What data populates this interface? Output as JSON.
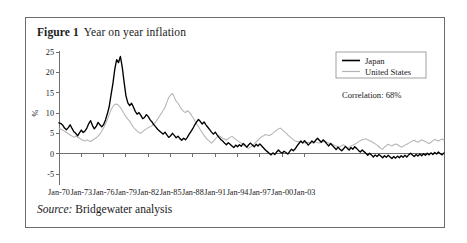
{
  "figure": {
    "label": "Figure 1",
    "title": "Year on year inflation",
    "source_word": "Source:",
    "source_text": "Bridgewater analysis"
  },
  "annotation": {
    "correlation": "Correlation: 68%"
  },
  "legend": {
    "items": [
      {
        "name": "Japan",
        "color": "#000000"
      },
      {
        "name": "United States",
        "color": "#b4b4b4"
      }
    ]
  },
  "chart_data": {
    "type": "line",
    "title": "Year on year inflation",
    "xlabel": "",
    "ylabel": "%",
    "ylim": [
      -5,
      25
    ],
    "yticks": [
      -5,
      0,
      5,
      10,
      15,
      20,
      25
    ],
    "ytick_labels": [
      "-5",
      "0",
      "5",
      "10",
      "15",
      "20",
      "25"
    ],
    "xlim": [
      "Jan-70",
      "Jan-05"
    ],
    "xticks": [
      "Jan-70",
      "Jan-73",
      "Jan-76",
      "Jan-79",
      "Jan-82",
      "Jan-85",
      "Jan-88",
      "Jan-91",
      "Jan-94",
      "Jan-97",
      "Jan-00",
      "Jan-03"
    ],
    "grid": false,
    "legend_position": "top-right",
    "x_start_year": 1970.0,
    "x_step_years": 0.25,
    "series": [
      {
        "name": "Japan",
        "color": "#000000",
        "values": [
          7.6,
          7.4,
          7.0,
          6.3,
          5.9,
          6.4,
          7.1,
          6.2,
          5.4,
          5.0,
          4.4,
          5.1,
          5.8,
          5.2,
          5.6,
          6.3,
          7.4,
          8.1,
          6.9,
          6.1,
          6.7,
          7.7,
          7.1,
          6.6,
          7.2,
          8.3,
          9.8,
          11.6,
          14.5,
          17.3,
          20.8,
          23.1,
          22.4,
          23.9,
          21.3,
          17.6,
          14.2,
          12.5,
          11.8,
          12.4,
          11.5,
          10.4,
          9.7,
          10.1,
          9.4,
          8.6,
          8.9,
          9.6,
          9.1,
          8.3,
          7.8,
          7.1,
          6.6,
          6.0,
          5.6,
          5.2,
          4.8,
          5.3,
          4.6,
          4.0,
          4.4,
          5.0,
          4.5,
          3.9,
          4.3,
          3.7,
          3.3,
          3.8,
          3.4,
          4.0,
          4.8,
          5.5,
          6.2,
          7.1,
          7.8,
          8.4,
          7.9,
          7.3,
          7.8,
          7.1,
          6.5,
          5.9,
          5.3,
          4.8,
          5.3,
          4.6,
          4.0,
          3.5,
          3.1,
          2.6,
          2.2,
          2.7,
          2.3,
          1.9,
          1.5,
          2.1,
          1.7,
          2.2,
          1.8,
          2.5,
          2.1,
          1.6,
          2.2,
          2.6,
          2.1,
          1.7,
          2.3,
          1.9,
          2.4,
          1.9,
          1.4,
          0.9,
          0.5,
          0.1,
          -0.3,
          0.2,
          -0.2,
          0.4,
          0.9,
          0.4,
          0.1,
          0.6,
          0.3,
          -0.1,
          0.5,
          1.1,
          0.7,
          1.2,
          1.9,
          2.5,
          3.1,
          2.6,
          3.2,
          2.7,
          2.1,
          2.6,
          3.1,
          2.7,
          3.3,
          3.8,
          3.3,
          2.8,
          3.4,
          3.0,
          2.4,
          1.9,
          2.5,
          2.0,
          1.5,
          1.0,
          1.6,
          1.1,
          0.7,
          1.2,
          1.8,
          1.3,
          0.9,
          1.5,
          1.1,
          1.7,
          1.3,
          0.8,
          0.4,
          0.9,
          0.5,
          0.1,
          -0.4,
          0.1,
          -0.3,
          -0.8,
          -0.3,
          -0.7,
          -0.2,
          -0.6,
          -1.0,
          -0.5,
          -0.9,
          -0.4,
          -0.8,
          -1.2,
          -0.7,
          -1.1,
          -0.6,
          -1.0,
          -0.5,
          -0.9,
          -0.4,
          -0.8,
          -0.3,
          0.1,
          -0.3,
          -0.7,
          -0.2,
          -0.6,
          -0.1,
          -0.5,
          0.0,
          -0.4,
          0.1,
          -0.3,
          0.2,
          -0.2,
          0.3,
          -0.1,
          0.4,
          0.0,
          -0.3,
          0.2
        ]
      },
      {
        "name": "United States",
        "color": "#b4b4b4",
        "values": [
          6.2,
          6.0,
          5.8,
          5.5,
          5.2,
          4.9,
          4.6,
          4.3,
          4.0,
          4.3,
          4.1,
          3.8,
          3.5,
          3.3,
          3.1,
          3.4,
          3.2,
          3.0,
          3.3,
          3.6,
          3.9,
          4.3,
          4.8,
          5.6,
          6.4,
          7.3,
          8.4,
          9.6,
          10.8,
          11.6,
          12.1,
          12.2,
          11.9,
          11.4,
          10.6,
          9.8,
          9.1,
          8.5,
          8.0,
          7.2,
          6.5,
          6.0,
          5.6,
          5.2,
          5.0,
          5.4,
          5.8,
          6.1,
          6.4,
          6.6,
          6.9,
          7.3,
          7.8,
          8.5,
          9.2,
          9.9,
          10.6,
          11.4,
          12.6,
          13.8,
          14.4,
          14.8,
          13.9,
          12.9,
          12.4,
          11.6,
          10.9,
          10.4,
          10.1,
          10.6,
          10.2,
          9.6,
          8.9,
          8.1,
          7.3,
          6.6,
          5.9,
          5.2,
          4.5,
          3.9,
          3.4,
          3.0,
          2.6,
          3.1,
          3.6,
          4.1,
          4.4,
          4.1,
          3.8,
          3.6,
          3.3,
          3.7,
          4.0,
          4.3,
          3.9,
          3.5,
          3.2,
          2.9,
          2.6,
          2.2,
          1.8,
          1.5,
          1.3,
          1.6,
          2.0,
          2.4,
          2.9,
          3.3,
          3.8,
          4.2,
          4.4,
          4.7,
          4.6,
          4.4,
          4.7,
          5.0,
          5.4,
          5.8,
          6.1,
          6.3,
          5.9,
          5.5,
          5.1,
          4.6,
          4.2,
          3.8,
          3.4,
          3.1,
          3.0,
          2.9,
          3.1,
          2.8,
          2.7,
          2.6,
          2.8,
          2.7,
          2.6,
          2.8,
          2.9,
          2.7,
          2.6,
          2.8,
          3.0,
          2.9,
          2.8,
          2.6,
          2.5,
          2.3,
          2.1,
          1.9,
          1.7,
          1.6,
          2.0,
          2.2,
          1.7,
          1.5,
          1.6,
          1.9,
          2.1,
          2.3,
          2.6,
          2.9,
          3.2,
          3.4,
          3.5,
          3.7,
          3.4,
          3.2,
          3.0,
          2.7,
          2.4,
          2.1,
          1.7,
          1.3,
          1.1,
          1.6,
          2.0,
          2.3,
          2.1,
          1.9,
          2.2,
          2.4,
          2.2,
          1.9,
          1.6,
          1.8,
          2.1,
          2.3,
          2.6,
          2.9,
          3.1,
          3.3,
          3.0,
          2.8,
          3.1,
          3.4,
          3.2,
          3.0,
          2.7,
          2.5,
          2.8,
          3.2,
          3.5,
          3.3,
          3.1,
          3.4,
          3.6,
          3.3
        ]
      }
    ]
  }
}
